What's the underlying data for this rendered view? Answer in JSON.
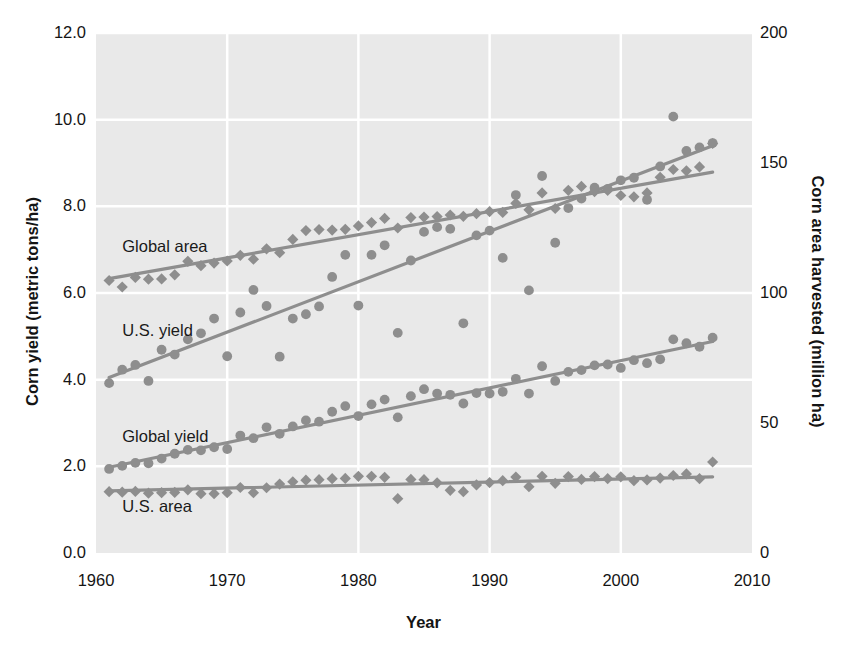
{
  "figure": {
    "top_caption_fragment": "",
    "background_color": "#ffffff",
    "plot_background_color": "#e9e9e9",
    "gridline_color": "#ffffff",
    "marker_color": "#8e8e8e",
    "trendline_color": "#8e8e8e",
    "text_color": "#141414"
  },
  "chart_data": {
    "type": "scatter",
    "title": "",
    "subtitle": "",
    "xlabel": "Year",
    "ylabel": "Corn yield (metric tons/ha)",
    "y2label": "Corn area harvested (million ha)",
    "xlim": [
      1960,
      2010
    ],
    "ylim": [
      0.0,
      12.0
    ],
    "y2lim": [
      0,
      200
    ],
    "xticks": [
      1960,
      1970,
      1980,
      1990,
      2000,
      2010
    ],
    "xticklabels": [
      "1960",
      "1970",
      "1980",
      "1990",
      "2000",
      "2010"
    ],
    "yticks": [
      0.0,
      2.0,
      4.0,
      6.0,
      8.0,
      10.0,
      12.0
    ],
    "yticklabels": [
      "0.0",
      "2.0",
      "4.0",
      "6.0",
      "8.0",
      "10.0",
      "12.0"
    ],
    "y2ticks": [
      0,
      50,
      100,
      150,
      200
    ],
    "y2ticklabels": [
      "0",
      "50",
      "100",
      "150",
      "200"
    ],
    "grid": true,
    "grid_axes": "both",
    "legend_position": "in-plot annotations",
    "annotations": [
      {
        "text": "Global area",
        "x": 1962.0,
        "y": 7.05,
        "name": "global-area"
      },
      {
        "text": "U.S. yield",
        "x": 1962.0,
        "y": 5.1,
        "name": "us-yield"
      },
      {
        "text": "Global yield",
        "x": 1962.0,
        "y": 2.65,
        "name": "global-yield"
      },
      {
        "text": "U.S. area",
        "x": 1962.0,
        "y": 1.05,
        "name": "us-area"
      }
    ],
    "series": [
      {
        "name": "Global area",
        "label": "Global area",
        "marker": "diamond",
        "axis": "right",
        "unit": "million ha",
        "x": [
          1961,
          1962,
          1963,
          1964,
          1965,
          1966,
          1967,
          1968,
          1969,
          1970,
          1971,
          1972,
          1973,
          1974,
          1975,
          1976,
          1977,
          1978,
          1979,
          1980,
          1981,
          1982,
          1983,
          1984,
          1985,
          1986,
          1987,
          1988,
          1989,
          1990,
          1991,
          1992,
          1993,
          1994,
          1995,
          1996,
          1997,
          1998,
          1999,
          2000,
          2001,
          2002,
          2003,
          2004,
          2005,
          2006,
          2007
        ],
        "values": [
          104.8,
          102.3,
          106.0,
          105.3,
          105.4,
          107.0,
          112.2,
          110.5,
          111.5,
          112.3,
          114.5,
          113.0,
          117.0,
          115.5,
          120.6,
          124.0,
          124.4,
          124.2,
          124.5,
          125.8,
          127.1,
          128.7,
          125.0,
          129.0,
          129.2,
          129.4,
          130.0,
          129.5,
          130.5,
          131.3,
          131.0,
          134.5,
          132.0,
          138.5,
          132.5,
          139.5,
          141.0,
          139.0,
          139.5,
          137.5,
          137.0,
          138.5,
          144.5,
          147.5,
          147.0,
          148.5,
          157.5
        ],
        "trend": {
          "x": [
            1961,
            2007
          ],
          "y": [
            105.5,
            146.5
          ]
        }
      },
      {
        "name": "U.S. yield",
        "label": "U.S. yield",
        "marker": "circle",
        "axis": "left",
        "unit": "metric tons/ha",
        "x": [
          1961,
          1962,
          1963,
          1964,
          1965,
          1966,
          1967,
          1968,
          1969,
          1970,
          1971,
          1972,
          1973,
          1974,
          1975,
          1976,
          1977,
          1978,
          1979,
          1980,
          1981,
          1982,
          1983,
          1984,
          1985,
          1986,
          1987,
          1988,
          1989,
          1990,
          1991,
          1992,
          1993,
          1994,
          1995,
          1996,
          1997,
          1998,
          1999,
          2000,
          2001,
          2002,
          2003,
          2004,
          2005,
          2006,
          2007
        ],
        "values": [
          3.92,
          4.23,
          4.34,
          3.97,
          4.69,
          4.58,
          4.93,
          5.07,
          5.41,
          4.54,
          5.55,
          6.07,
          5.7,
          4.53,
          5.41,
          5.51,
          5.69,
          6.37,
          6.88,
          5.71,
          6.88,
          7.1,
          5.08,
          6.75,
          7.41,
          7.52,
          7.48,
          5.3,
          7.33,
          7.44,
          6.81,
          8.26,
          6.06,
          8.7,
          7.16,
          7.96,
          8.18,
          8.43,
          8.4,
          8.6,
          8.66,
          8.15,
          8.92,
          10.07,
          9.28,
          9.36,
          9.46
        ],
        "trend": {
          "x": [
            1961,
            2007
          ],
          "y": [
            4.05,
            9.4
          ]
        }
      },
      {
        "name": "Global yield",
        "label": "Global yield",
        "marker": "circle",
        "axis": "left",
        "unit": "metric tons/ha",
        "x": [
          1961,
          1962,
          1963,
          1964,
          1965,
          1966,
          1967,
          1968,
          1969,
          1970,
          1971,
          1972,
          1973,
          1974,
          1975,
          1976,
          1977,
          1978,
          1979,
          1980,
          1981,
          1982,
          1983,
          1984,
          1985,
          1986,
          1987,
          1988,
          1989,
          1990,
          1991,
          1992,
          1993,
          1994,
          1995,
          1996,
          1997,
          1998,
          1999,
          2000,
          2001,
          2002,
          2003,
          2004,
          2005,
          2006,
          2007
        ],
        "values": [
          1.94,
          2.01,
          2.08,
          2.07,
          2.18,
          2.29,
          2.38,
          2.37,
          2.44,
          2.4,
          2.71,
          2.65,
          2.9,
          2.75,
          2.92,
          3.06,
          3.03,
          3.26,
          3.39,
          3.16,
          3.43,
          3.54,
          3.13,
          3.62,
          3.78,
          3.68,
          3.65,
          3.45,
          3.69,
          3.68,
          3.72,
          4.02,
          3.68,
          4.31,
          3.97,
          4.18,
          4.22,
          4.33,
          4.35,
          4.27,
          4.45,
          4.38,
          4.47,
          4.93,
          4.84,
          4.76,
          4.97
        ],
        "trend": {
          "x": [
            1961,
            2007
          ],
          "y": [
            1.98,
            4.88
          ]
        }
      },
      {
        "name": "U.S. area",
        "label": "U.S. area",
        "marker": "diamond",
        "axis": "right",
        "unit": "million ha",
        "x": [
          1961,
          1962,
          1963,
          1964,
          1965,
          1966,
          1967,
          1968,
          1969,
          1970,
          1971,
          1972,
          1973,
          1974,
          1975,
          1976,
          1977,
          1978,
          1979,
          1980,
          1981,
          1982,
          1983,
          1984,
          1985,
          1986,
          1987,
          1988,
          1989,
          1990,
          1991,
          1992,
          1993,
          1994,
          1995,
          1996,
          1997,
          1998,
          1999,
          2000,
          2001,
          2002,
          2003,
          2004,
          2005,
          2006,
          2007
        ],
        "values": [
          23.6,
          23.4,
          23.7,
          23.0,
          23.2,
          23.3,
          24.3,
          22.8,
          22.8,
          23.2,
          25.2,
          23.2,
          25.1,
          26.5,
          27.4,
          28.0,
          28.2,
          28.6,
          28.7,
          29.5,
          29.5,
          29.1,
          20.9,
          28.3,
          28.2,
          27.0,
          24.1,
          23.6,
          26.2,
          27.1,
          27.8,
          29.2,
          25.5,
          29.5,
          26.8,
          29.4,
          28.3,
          29.4,
          28.6,
          29.3,
          27.8,
          28.1,
          28.8,
          29.8,
          30.4,
          28.6,
          35.0
        ],
        "trend": {
          "x": [
            1961,
            2007
          ],
          "y": [
            23.9,
            29.3
          ]
        }
      }
    ]
  }
}
